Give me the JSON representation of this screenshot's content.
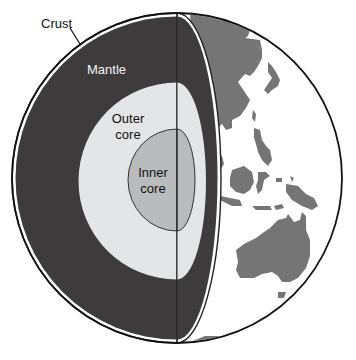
{
  "diagram": {
    "labels": {
      "crust": "Crust",
      "mantle": "Mantle",
      "outer_core_line1": "Outer",
      "outer_core_line2": "core",
      "inner_core_line1": "Inner",
      "inner_core_line2": "core"
    },
    "layers": [
      {
        "name": "Crust",
        "color": "#ffffff"
      },
      {
        "name": "Mantle",
        "color": "#3e3b3c"
      },
      {
        "name": "Outer core",
        "color": "#e3e5e6"
      },
      {
        "name": "Inner core",
        "color": "#b9bbbc"
      }
    ],
    "globe_surface": {
      "land_color": "#757575",
      "ocean_color": "#ffffff",
      "visible_region": [
        "East Asia",
        "Japan",
        "Southeast Asia",
        "Indonesia",
        "New Guinea",
        "Australia",
        "Antarctica"
      ]
    }
  }
}
